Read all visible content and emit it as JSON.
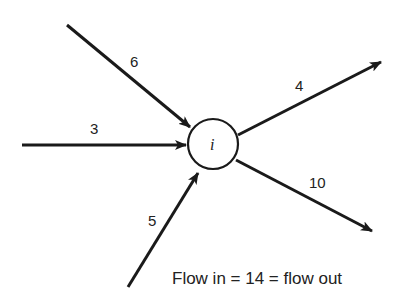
{
  "diagram": {
    "node": {
      "label": "i"
    },
    "incoming": [
      {
        "id": "in-6",
        "label": "6"
      },
      {
        "id": "in-3",
        "label": "3"
      },
      {
        "id": "in-5",
        "label": "5"
      }
    ],
    "outgoing": [
      {
        "id": "out-4",
        "label": "4"
      },
      {
        "id": "out-10",
        "label": "10"
      }
    ],
    "caption": "Flow in = 14 = flow out"
  }
}
